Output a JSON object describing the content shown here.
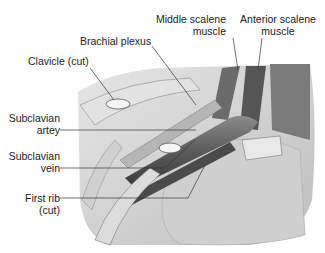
{
  "figure": {
    "labels": {
      "middle_scalene": [
        "Middle scalene",
        "muscle"
      ],
      "anterior_scalene": [
        "Anterior scalene",
        "muscle"
      ],
      "brachial_plexus": "Brachial plexus",
      "clavicle": "Clavicle (cut)",
      "subclavian_artery": [
        "Subclavian",
        "artey"
      ],
      "subclavian_vein": [
        "Subclavian",
        "vein"
      ],
      "first_rib": [
        "First rib",
        "(cut)"
      ]
    },
    "colors": {
      "background": "#ffffff",
      "text": "#222222",
      "leader_line": "#333333",
      "tissue_light": "#d9d9d9",
      "tissue_mid": "#9a9a9a",
      "tissue_dark": "#4a4a4a"
    }
  }
}
